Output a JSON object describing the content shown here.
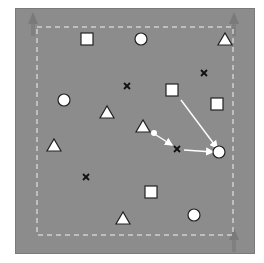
{
  "diagram": {
    "type": "training-drill-field",
    "field_color": "#8c8c8c",
    "boundary": {
      "style": "dashed",
      "color": "#d0d0d0",
      "x1": 37,
      "y1": 27,
      "x2": 233,
      "y2": 235
    },
    "goal_markers": [
      {
        "x": 33,
        "y": 22,
        "direction": "up"
      },
      {
        "x": 234,
        "y": 22,
        "direction": "up"
      },
      {
        "x": 234,
        "y": 238,
        "direction": "up"
      }
    ],
    "squares": [
      {
        "x": 87,
        "y": 39
      },
      {
        "x": 172,
        "y": 90
      },
      {
        "x": 217,
        "y": 104
      },
      {
        "x": 151,
        "y": 192
      }
    ],
    "circles": [
      {
        "x": 141,
        "y": 39
      },
      {
        "x": 64,
        "y": 100
      },
      {
        "x": 219,
        "y": 152
      },
      {
        "x": 194,
        "y": 215
      }
    ],
    "triangles": [
      {
        "x": 225,
        "y": 39
      },
      {
        "x": 107,
        "y": 112
      },
      {
        "x": 143,
        "y": 126
      },
      {
        "x": 54,
        "y": 145
      },
      {
        "x": 123,
        "y": 218
      }
    ],
    "crosses": [
      {
        "x": 127,
        "y": 86
      },
      {
        "x": 204,
        "y": 73
      },
      {
        "x": 177,
        "y": 149
      },
      {
        "x": 86,
        "y": 177
      }
    ],
    "ball": {
      "x": 154,
      "y": 133
    },
    "arrows": [
      {
        "x1": 181,
        "y1": 100,
        "x2": 217,
        "y2": 148,
        "style": "solid"
      },
      {
        "x1": 156,
        "y1": 135,
        "x2": 172,
        "y2": 145,
        "style": "solid"
      },
      {
        "x1": 184,
        "y1": 150,
        "x2": 213,
        "y2": 152,
        "style": "solid"
      }
    ]
  }
}
